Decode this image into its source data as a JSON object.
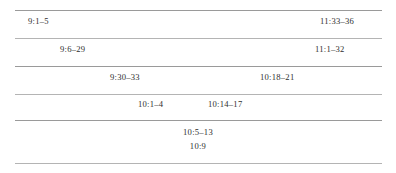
{
  "document": {
    "type": "chiastic-structure-diagram",
    "background_color": "#ffffff",
    "text_color": "#2e2e2e",
    "rule_color": "#9a9a9a"
  },
  "rules": [
    {
      "id": "rule-top",
      "y": 10
    },
    {
      "id": "rule-1",
      "y": 38
    },
    {
      "id": "rule-2",
      "y": 66
    },
    {
      "id": "rule-3",
      "y": 94
    },
    {
      "id": "rule-4",
      "y": 120
    },
    {
      "id": "rule-bottom",
      "y": 163
    }
  ],
  "rows": [
    {
      "level": 1,
      "band_top": 14,
      "left": {
        "label": "9:1–5",
        "x": 28
      },
      "right": {
        "label": "11:33–36",
        "x": 320
      }
    },
    {
      "level": 2,
      "band_top": 42,
      "left": {
        "label": "9:6–29",
        "x": 60
      },
      "right": {
        "label": "11:1–32",
        "x": 315
      }
    },
    {
      "level": 3,
      "band_top": 70,
      "left": {
        "label": "9:30–33",
        "x": 110
      },
      "right": {
        "label": "10:18–21",
        "x": 260
      }
    },
    {
      "level": 4,
      "band_top": 97,
      "left": {
        "label": "10:1–4",
        "x": 138
      },
      "right": {
        "label": "10:14–17",
        "x": 208
      }
    }
  ],
  "center": {
    "level": 5,
    "band_top": 125,
    "primary": {
      "label": "10:5–13"
    },
    "secondary": {
      "label": "10:9"
    }
  }
}
